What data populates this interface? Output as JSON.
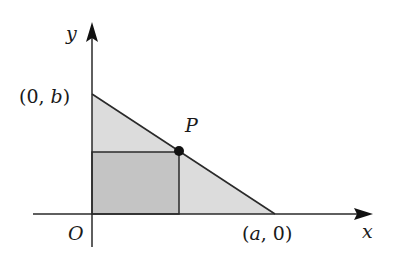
{
  "diagram": {
    "type": "coordinate-geometry",
    "colors": {
      "triangle_fill": "#dcdcdc",
      "rectangle_fill": "#c4c4c4",
      "stroke": "#2a2a2a",
      "point": "#111111"
    },
    "axes": {
      "x_label": "x",
      "y_label": "y",
      "origin_label": "O"
    },
    "points": {
      "y_intercept_label": "(0,  b)",
      "x_intercept_label": "(a,  0)",
      "point_label": "P"
    },
    "labels": {
      "y_intercept_open": "(0,  ",
      "y_intercept_var": "b",
      "y_intercept_close": ")",
      "x_intercept_open": "(",
      "x_intercept_var": "a",
      "x_intercept_close": ",  0)"
    }
  }
}
